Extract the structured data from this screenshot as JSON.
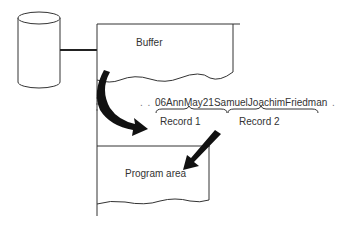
{
  "diagram": {
    "disk_label": "",
    "buffer_label": "Buffer",
    "data_stream": "06AnnMay21SamuelJoachimFriedman",
    "leading_dots": ". . .",
    "trailing_dots": ". . .",
    "records": [
      {
        "label": "Record 1"
      },
      {
        "label": "Record 2"
      }
    ],
    "program_area_label": "Program area"
  }
}
